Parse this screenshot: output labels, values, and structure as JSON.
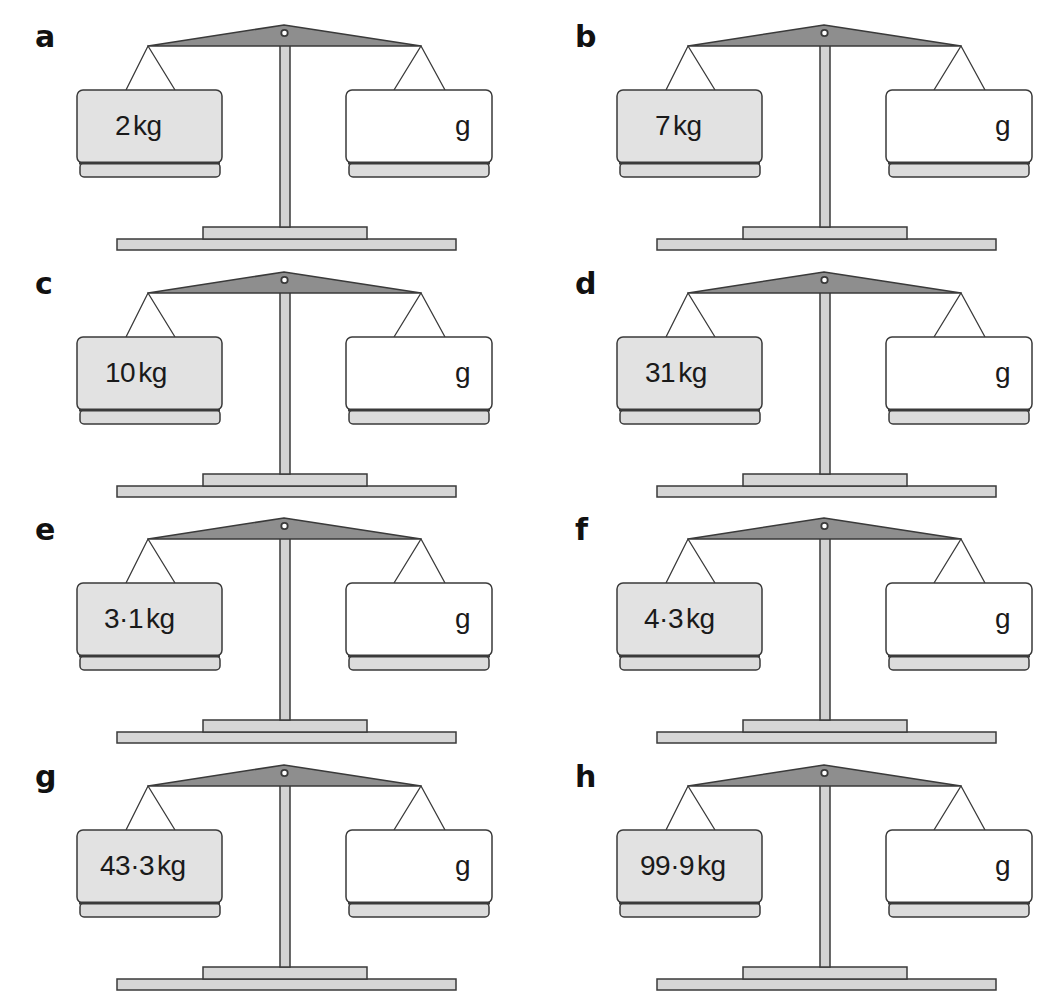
{
  "colors": {
    "beam": "#8e8e8e",
    "post": "#d3d3d3",
    "base": "#d6d6d6",
    "pan_filled": "#e2e2e2",
    "pan_empty": "#ffffff",
    "tray": "#dcdcdc",
    "outline": "#3a3a3a"
  },
  "panels": [
    {
      "label": "a",
      "left_weight": "2",
      "left_unit": "kg",
      "right_unit": "g",
      "right_value": ""
    },
    {
      "label": "b",
      "left_weight": "7",
      "left_unit": "kg",
      "right_unit": "g",
      "right_value": ""
    },
    {
      "label": "c",
      "left_weight": "10",
      "left_unit": "kg",
      "right_unit": "g",
      "right_value": ""
    },
    {
      "label": "d",
      "left_weight": "31",
      "left_unit": "kg",
      "right_unit": "g",
      "right_value": ""
    },
    {
      "label": "e",
      "left_weight": "3·1",
      "left_unit": "kg",
      "right_unit": "g",
      "right_value": ""
    },
    {
      "label": "f",
      "left_weight": "4·3",
      "left_unit": "kg",
      "right_unit": "g",
      "right_value": ""
    },
    {
      "label": "g",
      "left_weight": "43·3",
      "left_unit": "kg",
      "right_unit": "g",
      "right_value": ""
    },
    {
      "label": "h",
      "left_weight": "99·9",
      "left_unit": "kg",
      "right_unit": "g",
      "right_value": ""
    }
  ]
}
